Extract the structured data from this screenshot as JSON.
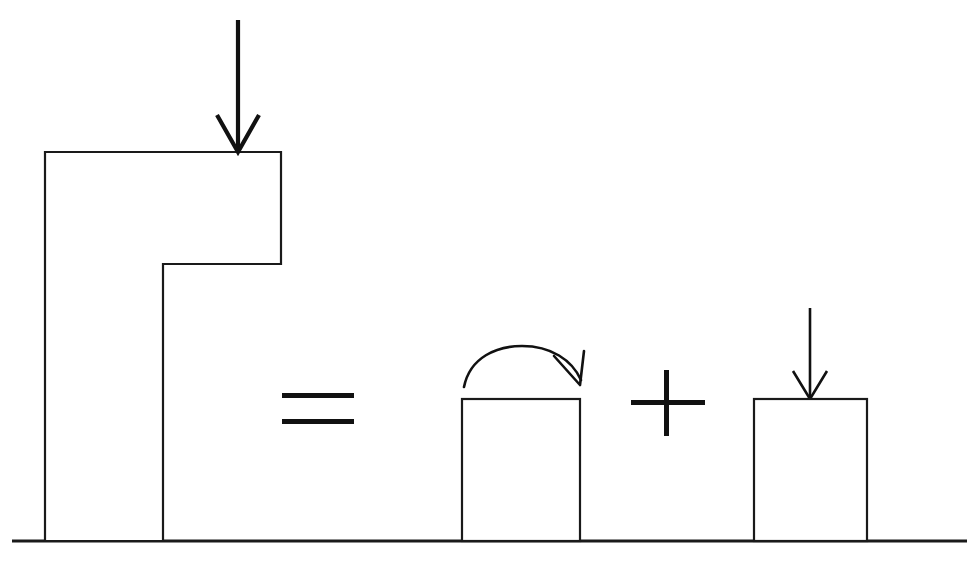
{
  "figure": {
    "background_color": "#ffffff",
    "line_color": "#1a1a1a",
    "arrow_color": "#111111",
    "width": 976,
    "height": 561
  },
  "operators": {
    "equals": {
      "symbol": "=",
      "name": "equals-sign",
      "x": 318,
      "y": 410,
      "bar_width": 72,
      "bar_height": 5,
      "gap": 16
    },
    "plus": {
      "symbol": "+",
      "name": "plus-sign",
      "x": 668,
      "y": 403,
      "arm_half_length_h": 37,
      "arm_half_length_v": 33,
      "thickness": 5
    }
  },
  "ground": {
    "label": "ground-line",
    "x1": 12,
    "x2": 967,
    "y": 541
  },
  "shapes": [
    {
      "id": "stepped-block",
      "label": "stepped-L-block",
      "description": "L-shaped stepped block resting on ground",
      "points": "45,152 281,152 281,264 163,264 163,541 45,541",
      "top_left_x": 45,
      "top_y": 152,
      "step_x": 163,
      "step_y": 264,
      "right_x": 281,
      "base_y": 541
    },
    {
      "id": "middle-block",
      "label": "middle-rectangle",
      "description": "rectangle with rotation arrow above",
      "x": 462,
      "y": 399,
      "width": 118,
      "height": 142
    },
    {
      "id": "right-block",
      "label": "right-rectangle",
      "description": "rectangle with downward load arrow",
      "x": 754,
      "y": 399,
      "width": 113,
      "height": 142
    }
  ],
  "arrows": [
    {
      "id": "main-load-arrow",
      "label": "downward-load-arrow-on-stepped-block",
      "direction": "down",
      "tail_x": 238,
      "tail_y": 20,
      "tip_x": 238,
      "tip_y": 152,
      "head_half_width": 21,
      "head_length": 37,
      "stroke_width": 4.2
    },
    {
      "id": "right-load-arrow",
      "label": "downward-load-arrow-on-right-rectangle",
      "direction": "down",
      "tail_x": 810,
      "tail_y": 308,
      "tip_x": 810,
      "tip_y": 399,
      "head_half_width": 17,
      "head_length": 28,
      "stroke_width": 2.6
    },
    {
      "id": "moment-arrow",
      "label": "curved-moment-arrow-clockwise",
      "direction": "clockwise",
      "start_x": 464,
      "start_y": 387,
      "peak_x": 522,
      "peak_y": 346,
      "end_x": 580,
      "end_y": 384,
      "head_length": 26,
      "stroke_width": 2.6
    }
  ]
}
